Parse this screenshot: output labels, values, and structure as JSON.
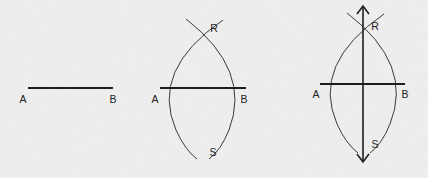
{
  "diagram": {
    "type": "perpendicular-bisector-construction",
    "stroke_color": "#1e1e1e",
    "arc_color": "#3a3a3a",
    "background": "#efefef",
    "panels": [
      {
        "id": "step-1",
        "labels": {
          "a": "A",
          "b": "B"
        },
        "segment": {
          "x1": 28,
          "y1": 88,
          "x2": 113,
          "y2": 88
        },
        "label_positions": {
          "a": [
            23,
            99
          ],
          "b": [
            113,
            99
          ]
        }
      },
      {
        "id": "step-2",
        "labels": {
          "a": "A",
          "b": "B",
          "r": "R",
          "s": "S"
        },
        "segment": {
          "x1": 160,
          "y1": 88,
          "x2": 246,
          "y2": 88
        },
        "label_positions": {
          "a": [
            155,
            99
          ],
          "b": [
            244,
            99
          ],
          "r": [
            214,
            28
          ],
          "s": [
            213,
            152
          ]
        }
      },
      {
        "id": "step-3",
        "labels": {
          "a": "A",
          "b": "B",
          "r": "R",
          "s": "S"
        },
        "segment": {
          "x1": 320,
          "y1": 84,
          "x2": 405,
          "y2": 84
        },
        "bisector": {
          "x": 363,
          "y1": 6,
          "y2": 162
        },
        "label_positions": {
          "a": [
            316,
            94
          ],
          "b": [
            405,
            94
          ],
          "r": [
            375,
            26
          ],
          "s": [
            375,
            144
          ]
        }
      }
    ]
  }
}
